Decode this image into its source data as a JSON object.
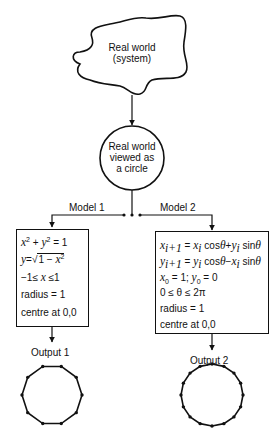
{
  "diagram": {
    "type": "flowchart",
    "nodes": {
      "real_world": {
        "line1": "Real world",
        "line2": "(system)"
      },
      "circle_view": {
        "line1": "Real world",
        "line2": "viewed as",
        "line3": "a circle"
      }
    },
    "branches": {
      "model1": {
        "label": "Model 1",
        "equations": [
          "x² + y² = 1",
          "y = √(1 − x²)",
          "−1 ≤ x ≤ 1",
          "radius = 1",
          "centre at 0,0"
        ],
        "eq_parts": {
          "l1a": "x",
          "l1b": "2",
          "l1c": " + ",
          "l1d": "y",
          "l1e": "2",
          "l1f": " = 1",
          "l2a": "y",
          "l2b": "=√",
          "l2c": "1 − ",
          "l2d": "x",
          "l2e": "2",
          "l3a": "−1≤ ",
          "l3b": "x",
          "l3c": " ≤1",
          "l4": "radius = 1",
          "l5": "centre at 0,0"
        },
        "output_label": "Output 1",
        "output_vertices": 10
      },
      "model2": {
        "label": "Model 2",
        "equations": [
          "x(i+1) = x(i) cosθ + y(i) sinθ",
          "y(i+1) = y(i) cosθ − x(i) sinθ",
          "x0 = 1; y0 = 0",
          "0 ≤ θ ≤ 2π",
          "radius = 1",
          "centre at 0,0"
        ],
        "eq_parts": {
          "l1": [
            "x",
            "i+1",
            " = ",
            "x",
            "i",
            " cos",
            "θ",
            "+",
            "y",
            "i",
            " sin",
            "θ"
          ],
          "l2": [
            "y",
            "i+1",
            " = ",
            "y",
            "i",
            " cos",
            "θ",
            "−",
            "x",
            "i",
            " sin",
            "θ"
          ],
          "l3": [
            "x",
            "0",
            " = 1;  ",
            "y",
            "0",
            " = 0"
          ],
          "l4": "0 ≤ θ ≤ 2π",
          "l5": "radius = 1",
          "l6": "centre at 0,0"
        },
        "output_label": "Output 2",
        "output_vertices": 16
      }
    },
    "colors": {
      "ink": "#111111",
      "background": "#ffffff"
    }
  }
}
